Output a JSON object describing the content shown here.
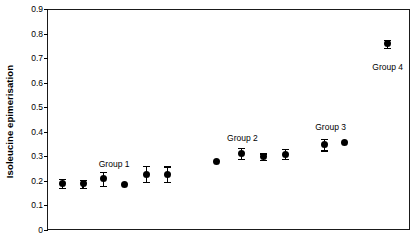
{
  "chart_data": {
    "type": "scatter",
    "title": "",
    "xlabel": "",
    "ylabel": "Isoleucine epimerisation",
    "ylim": [
      0,
      0.9
    ],
    "yticks": [
      "0",
      "0.1",
      "0.2",
      "0.3",
      "0.4",
      "0.5",
      "0.6",
      "0.7",
      "0.8",
      "0.9"
    ],
    "ytick_values": [
      0,
      0.1,
      0.2,
      0.3,
      0.4,
      0.5,
      0.6,
      0.7,
      0.8,
      0.9
    ],
    "xlim": [
      0,
      14
    ],
    "xticks": [],
    "xtick_labels": [],
    "grid": false,
    "legend": false,
    "error_bars": "vertical",
    "series": [
      {
        "name": "Isoleucine epimerisation",
        "marker": "filled-circle",
        "color": "#000000",
        "points": [
          {
            "x": 0.55,
            "y": 0.193,
            "err": 0.018
          },
          {
            "x": 1.35,
            "y": 0.192,
            "err": 0.017
          },
          {
            "x": 2.15,
            "y": 0.213,
            "err": 0.029
          },
          {
            "x": 2.95,
            "y": 0.19,
            "err": 0.0
          },
          {
            "x": 3.8,
            "y": 0.232,
            "err": 0.032
          },
          {
            "x": 4.6,
            "y": 0.231,
            "err": 0.032
          },
          {
            "x": 6.5,
            "y": 0.282,
            "err": 0.0
          },
          {
            "x": 7.45,
            "y": 0.316,
            "err": 0.022
          },
          {
            "x": 8.3,
            "y": 0.303,
            "err": 0.013
          },
          {
            "x": 9.15,
            "y": 0.313,
            "err": 0.021
          },
          {
            "x": 10.65,
            "y": 0.352,
            "err": 0.024
          },
          {
            "x": 11.45,
            "y": 0.36,
            "err": 0.0
          },
          {
            "x": 13.1,
            "y": 0.762,
            "err": 0.016
          }
        ]
      }
    ],
    "annotations": [
      {
        "text": "Group 1",
        "x": 2.55,
        "y": 0.293
      },
      {
        "text": "Group 2",
        "x": 7.5,
        "y": 0.4
      },
      {
        "text": "Group 3",
        "x": 10.9,
        "y": 0.443
      },
      {
        "text": "Group 4",
        "x": 13.1,
        "y": 0.688
      }
    ]
  }
}
